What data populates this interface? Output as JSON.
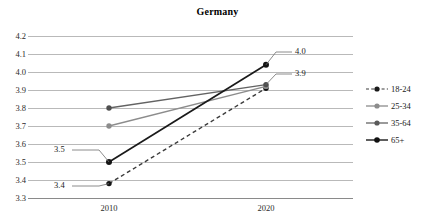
{
  "chart_data": {
    "type": "line",
    "title": "Germany",
    "xlabel": "",
    "ylabel": "",
    "x": [
      "2010",
      "2020"
    ],
    "categories": [
      "2010",
      "2020"
    ],
    "ylim": [
      3.3,
      4.2
    ],
    "ytick_labels": [
      "4.2",
      "4.1",
      "4.0",
      "3.9",
      "3.8",
      "3.7",
      "3.6",
      "3.5",
      "3.4",
      "3.3"
    ],
    "ytick_values": [
      4.2,
      4.1,
      4.0,
      3.9,
      3.8,
      3.7,
      3.6,
      3.5,
      3.4,
      3.3
    ],
    "grid": true,
    "legend_position": "right",
    "series": [
      {
        "name": "18-24",
        "values": [
          3.38,
          3.91
        ],
        "style": "dashed",
        "color": "#3b3b3b",
        "marker": "circle"
      },
      {
        "name": "25-34",
        "values": [
          3.7,
          3.92
        ],
        "style": "solid",
        "color": "#8c8c8c",
        "marker": "circle"
      },
      {
        "name": "35-64",
        "values": [
          3.8,
          3.93
        ],
        "style": "solid",
        "color": "#636363",
        "marker": "circle"
      },
      {
        "name": "65+",
        "values": [
          3.5,
          4.04
        ],
        "style": "solid",
        "color": "#1a1a1a",
        "marker": "circle"
      }
    ],
    "annotations": [
      {
        "text": "3.5",
        "series": "65+",
        "point": "2010",
        "value": 3.5,
        "side": "left"
      },
      {
        "text": "3.4",
        "series": "18-24",
        "point": "2010",
        "value": 3.38,
        "side": "left"
      },
      {
        "text": "4.0",
        "series": "65+",
        "point": "2020",
        "value": 4.04,
        "side": "right"
      },
      {
        "text": "3.9",
        "series": "35-64",
        "point": "2020",
        "value": 3.93,
        "side": "right"
      }
    ]
  },
  "legend": {
    "items": [
      {
        "label": "18-24"
      },
      {
        "label": "25-34"
      },
      {
        "label": "35-64"
      },
      {
        "label": "65+"
      }
    ]
  },
  "axis": {
    "y_labels": [
      "4.2",
      "4.1",
      "4.0",
      "3.9",
      "3.8",
      "3.7",
      "3.6",
      "3.5",
      "3.4",
      "3.3"
    ],
    "x_labels": [
      "2010",
      "2020"
    ]
  },
  "labels": {
    "left_top": "3.5",
    "left_bottom": "3.4",
    "right_top": "4.0",
    "right_bottom": "3.9"
  }
}
